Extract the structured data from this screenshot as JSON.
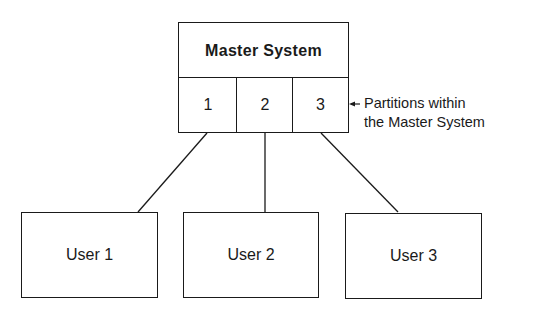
{
  "diagram": {
    "master": {
      "title": "Master System"
    },
    "partitions": [
      {
        "label": "1"
      },
      {
        "label": "2"
      },
      {
        "label": "3"
      }
    ],
    "annotation": {
      "line1": "Partitions within",
      "line2": "the Master System"
    },
    "users": [
      {
        "label": "User 1"
      },
      {
        "label": "User 2"
      },
      {
        "label": "User 3"
      }
    ],
    "connections": [
      {
        "from": "partition-1",
        "to": "User 1"
      },
      {
        "from": "partition-2",
        "to": "User 2"
      },
      {
        "from": "partition-3",
        "to": "User 3"
      }
    ],
    "colors": {
      "stroke": "#1a1a1a",
      "background": "#ffffff"
    }
  }
}
